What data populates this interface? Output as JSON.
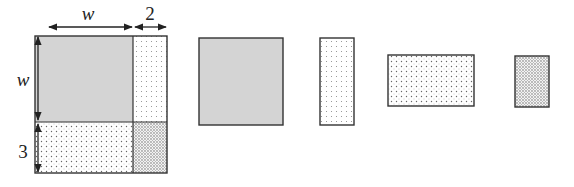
{
  "diagram": {
    "type": "area-model",
    "labels": {
      "top_width": "w",
      "top_extra": "2",
      "left_height": "w",
      "left_extra": "3"
    },
    "pieces": [
      {
        "name": "w-by-w square",
        "fill": "gray",
        "dims": "w × w"
      },
      {
        "name": "2-by-w strip",
        "fill": "light-dots",
        "dims": "2 × w"
      },
      {
        "name": "w-by-3 rectangle",
        "fill": "medium-dots",
        "dims": "w × 3"
      },
      {
        "name": "2-by-3 rectangle",
        "fill": "dense-dots",
        "dims": "2 × 3"
      }
    ],
    "colors": {
      "stroke": "#333333",
      "gray_fill": "#d3d3d3",
      "dot_color": "#555555"
    }
  }
}
